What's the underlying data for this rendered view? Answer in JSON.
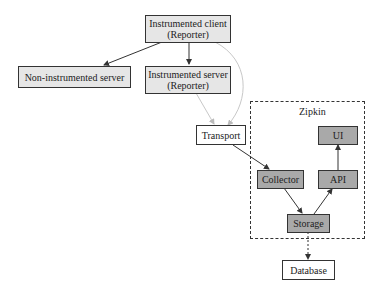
{
  "diagram": {
    "nodes": {
      "instrumented_client": {
        "line1": "Instrumented client",
        "line2": "(Reporter)"
      },
      "non_instrumented_server": {
        "label": "Non-instrumented server"
      },
      "instrumented_server": {
        "line1": "Instrumented server",
        "line2": "(Reporter)"
      },
      "transport": {
        "label": "Transport"
      },
      "ui": {
        "label": "UI"
      },
      "collector": {
        "label": "Collector"
      },
      "api": {
        "label": "API"
      },
      "storage": {
        "label": "Storage"
      },
      "database": {
        "label": "Database"
      }
    },
    "group": {
      "label": "Zipkin"
    },
    "edges": [
      {
        "from": "Instrumented client",
        "to": "Non-instrumented server",
        "style": "solid"
      },
      {
        "from": "Instrumented client",
        "to": "Instrumented server",
        "style": "solid"
      },
      {
        "from": "Instrumented client",
        "to": "Transport",
        "style": "light"
      },
      {
        "from": "Instrumented server",
        "to": "Transport",
        "style": "light"
      },
      {
        "from": "Transport",
        "to": "Collector",
        "style": "solid"
      },
      {
        "from": "Collector",
        "to": "Storage",
        "style": "solid"
      },
      {
        "from": "Storage",
        "to": "API",
        "style": "solid"
      },
      {
        "from": "API",
        "to": "UI",
        "style": "solid"
      },
      {
        "from": "Storage",
        "to": "Database",
        "style": "dashed"
      }
    ],
    "colors": {
      "light_fill": "#e6e6e6",
      "dark_fill": "#a9a9a9",
      "light_edge": "#c8c8c8",
      "edge": "#333333"
    }
  }
}
